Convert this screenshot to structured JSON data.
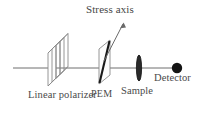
{
  "figure": {
    "title": "",
    "type": "optical-setup-schematic",
    "background_color": "#ffffff",
    "line_color": "#6e6e6e",
    "text_color": "#4a4a4a",
    "dark_color": "#1a1a1a"
  },
  "labels": {
    "stress_axis": "Stress axis",
    "linear_polarizer": "Linear polarizer",
    "pem": "PEM",
    "sample": "Sample",
    "detector": "Detector"
  },
  "components": [
    {
      "name": "linear-polarizer",
      "label": "Linear polarizer",
      "shape": "parallelepiped-stack",
      "x": 57,
      "y": 68
    },
    {
      "name": "pem",
      "label": "PEM",
      "shape": "parallelogram-with-diagonal",
      "x": 110,
      "y": 68
    },
    {
      "name": "sample",
      "label": "Sample",
      "shape": "vertical-ellipse",
      "x": 139,
      "y": 68
    },
    {
      "name": "detector",
      "label": "Detector",
      "shape": "filled-circle",
      "x": 177,
      "y": 68
    }
  ],
  "beam": {
    "name": "optical-axis",
    "x_start": 13,
    "x_end": 177,
    "y": 68
  },
  "arrow": {
    "name": "stress-axis-arrow",
    "x_start": 103,
    "y_start": 62,
    "x_end": 124,
    "y_end": 22
  }
}
